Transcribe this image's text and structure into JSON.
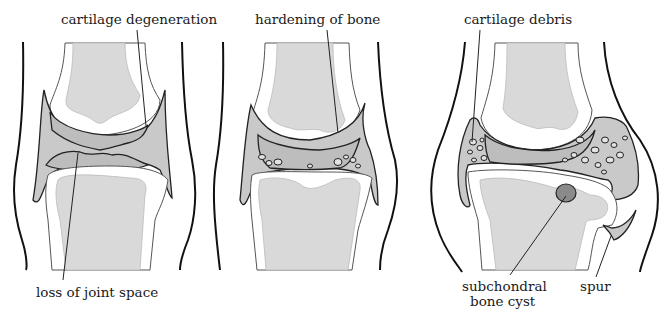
{
  "panels": [
    {
      "id": "panel-1",
      "labels": {
        "top": "cartilage degeneration",
        "bottom": "loss of joint space"
      }
    },
    {
      "id": "panel-2",
      "labels": {
        "top": "hardening of bone"
      }
    },
    {
      "id": "panel-3",
      "labels": {
        "top": "cartilage debris",
        "bottom_left_line1": "subchondral",
        "bottom_left_line2": "bone cyst",
        "bottom_right": "spur"
      }
    }
  ],
  "colors": {
    "outline": "#111111",
    "bone_marrow": "#d9d9d9",
    "capsule": "#c9c9c9",
    "cyst": "#8a8a8a"
  }
}
